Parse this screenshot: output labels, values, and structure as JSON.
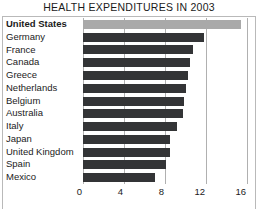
{
  "chart_data": {
    "type": "bar",
    "orientation": "horizontal",
    "title": "HEALTH EXPENDITURES IN 2003",
    "xlabel": "",
    "ylabel": "",
    "xlim": [
      0,
      16
    ],
    "xticks": [
      0,
      4,
      8,
      12,
      16
    ],
    "xtick_labels": [
      "0",
      "4",
      "8",
      "12",
      "16"
    ],
    "grid": true,
    "grid_axis": "x",
    "legend": null,
    "categories": [
      "United States",
      "Germany",
      "France",
      "Canada",
      "Greece",
      "Netherlands",
      "Belgium",
      "Australia",
      "Italy",
      "Japan",
      "United Kingdom",
      "Spain",
      "Mexico"
    ],
    "values": [
      15.4,
      11.8,
      10.7,
      10.4,
      10.2,
      10.0,
      9.9,
      9.8,
      9.2,
      8.5,
      8.5,
      8.1,
      7.0
    ],
    "highlighted_category": "United States",
    "colors": {
      "bar": "#333436",
      "bar_highlight": "#a9a9a9",
      "grid": "#b0b0b0",
      "frame": "#b9b9b9",
      "text": "#1b1b1b"
    }
  }
}
